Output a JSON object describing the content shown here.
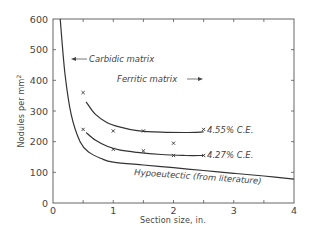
{
  "chart_data": {
    "type": "line",
    "title": "",
    "xlabel": "Section size, in.",
    "ylabel": "Nodules per mm²",
    "xlim": [
      0,
      4
    ],
    "ylim": [
      0,
      600
    ],
    "xticks": [
      0,
      1,
      2,
      3,
      4
    ],
    "xtick_labels": [
      "0",
      "1",
      "2",
      "3",
      "4"
    ],
    "x_minor_ticks": [
      0.5,
      1.5,
      2.5,
      3.5
    ],
    "yticks": [
      0,
      100,
      200,
      300,
      400,
      500,
      600
    ],
    "ytick_labels": [
      "0",
      "100",
      "200",
      "300",
      "400",
      "500",
      "600"
    ],
    "grid": false,
    "legend": null,
    "series": [
      {
        "name": "4.55% C.E.",
        "kind": "curve+markers",
        "curve": {
          "x": [
            0.55,
            0.7,
            0.9,
            1.1,
            1.4,
            1.8,
            2.2,
            2.5
          ],
          "y": [
            330,
            290,
            262,
            248,
            236,
            231,
            230,
            232
          ]
        },
        "markers": {
          "x": [
            0.5,
            1.0,
            1.5,
            2.5
          ],
          "y": [
            360,
            235,
            235,
            240
          ]
        }
      },
      {
        "name": "4.27% C.E.",
        "kind": "curve+markers",
        "curve": {
          "x": [
            0.55,
            0.7,
            0.9,
            1.1,
            1.4,
            1.8,
            2.2,
            2.5
          ],
          "y": [
            230,
            205,
            185,
            173,
            165,
            158,
            155,
            155
          ]
        },
        "markers": {
          "x": [
            0.5,
            1.0,
            1.5,
            2.0,
            2.0,
            2.5
          ],
          "y": [
            240,
            175,
            170,
            195,
            155,
            155
          ]
        }
      },
      {
        "name": "Hypoeutectic (from literature)",
        "kind": "curve",
        "curve": {
          "x": [
            0.12,
            0.2,
            0.3,
            0.45,
            0.6,
            0.8,
            1.0,
            1.5,
            2.0,
            2.5,
            3.0,
            3.5,
            4.0
          ],
          "y": [
            600,
            420,
            290,
            200,
            165,
            145,
            133,
            124,
            115,
            106,
            97,
            88,
            78
          ]
        }
      }
    ],
    "annotations": [
      {
        "text": "Carbidic matrix",
        "x": 0.38,
        "y": 460,
        "arrow": "left"
      },
      {
        "text": "Ferritic matrix",
        "x": 1.4,
        "y": 395,
        "arrow": "right"
      },
      {
        "text": "4.55% C.E.",
        "x": 2.55,
        "y": 240
      },
      {
        "text": "4.27% C.E.",
        "x": 2.55,
        "y": 152
      },
      {
        "text": "Hypoeutectic (from literature)",
        "x": 1.6,
        "y": 100
      }
    ]
  },
  "labels": {
    "carbidic": "Carbidic matrix",
    "ferritic": "Ferritic matrix",
    "ce455": "4.55% C.E.",
    "ce427": "4.27% C.E.",
    "hypo": "Hypoeutectic (from literature)",
    "xlabel": "Section size, in.",
    "ylabel_main": "Nodules per mm",
    "ylabel_sup": "2"
  }
}
